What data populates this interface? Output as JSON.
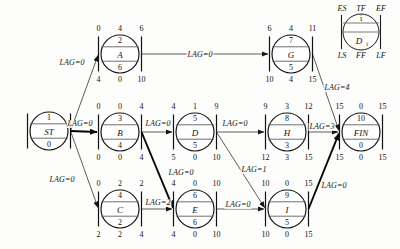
{
  "diagram": {
    "legend": {
      "top": [
        "ES",
        "TF",
        "EF"
      ],
      "bottom": [
        "LS",
        "FF",
        "LF"
      ],
      "id": "i",
      "name": "D",
      "name_sub": "i"
    },
    "nodes": [
      {
        "key": "ST",
        "id": "1",
        "name": "ST",
        "dur": "0",
        "es": "",
        "tf": "",
        "ef": "",
        "ls": "",
        "ff": "",
        "lf": "",
        "cx": 49,
        "cy": 131,
        "r": 19
      },
      {
        "key": "A",
        "id": "2",
        "name": "A",
        "dur": "6",
        "es": "0",
        "tf": "4",
        "ef": "6",
        "ls": "4",
        "ff": "0",
        "lf": "10",
        "cx": 120,
        "cy": 54,
        "r": 19
      },
      {
        "key": "B",
        "id": "3",
        "name": "B",
        "dur": "4",
        "es": "0",
        "tf": "0",
        "ef": "4",
        "ls": "0",
        "ff": "0",
        "lf": "4",
        "cx": 120,
        "cy": 132,
        "r": 19
      },
      {
        "key": "C",
        "id": "4",
        "name": "C",
        "dur": "2",
        "es": "0",
        "tf": "2",
        "ef": "2",
        "ls": "2",
        "ff": "2",
        "lf": "4",
        "cx": 120,
        "cy": 209,
        "r": 19
      },
      {
        "key": "D",
        "id": "5",
        "name": "D",
        "dur": "5",
        "es": "4",
        "tf": "1",
        "ef": "9",
        "ls": "5",
        "ff": "0",
        "lf": "10",
        "cx": 195,
        "cy": 132,
        "r": 19
      },
      {
        "key": "E",
        "id": "6",
        "name": "E",
        "dur": "6",
        "es": "4",
        "tf": "0",
        "ef": "10",
        "ls": "4",
        "ff": "0",
        "lf": "10",
        "cx": 195,
        "cy": 209,
        "r": 19
      },
      {
        "key": "G",
        "id": "7",
        "name": "G",
        "dur": "5",
        "es": "6",
        "tf": "4",
        "ef": "11",
        "ls": "10",
        "ff": "4",
        "lf": "15",
        "cx": 291,
        "cy": 54,
        "r": 19
      },
      {
        "key": "H",
        "id": "8",
        "name": "H",
        "dur": "3",
        "es": "9",
        "tf": "3",
        "ef": "12",
        "ls": "12",
        "ff": "3",
        "lf": "15",
        "cx": 287,
        "cy": 132,
        "r": 19
      },
      {
        "key": "I",
        "id": "9",
        "name": "I",
        "dur": "5",
        "es": "10",
        "tf": "0",
        "ef": "15",
        "ls": "10",
        "ff": "0",
        "lf": "15",
        "cx": 287,
        "cy": 209,
        "r": 19
      },
      {
        "key": "FIN",
        "id": "10",
        "name": "FIN",
        "dur": "0",
        "es": "15",
        "tf": "0",
        "ef": "15",
        "ls": "15",
        "ff": "0",
        "lf": "15",
        "cx": 361,
        "cy": 132,
        "r": 19
      }
    ],
    "edges": [
      {
        "from": "ST",
        "to": "A",
        "lag_label": "LAG=0",
        "lx": 72,
        "ly": 63,
        "heavy": false
      },
      {
        "from": "ST",
        "to": "B",
        "lag_label": "LAG=0",
        "lx": 80,
        "ly": 124,
        "heavy": true
      },
      {
        "from": "ST",
        "to": "C",
        "lag_label": "LAG=0",
        "lx": 62,
        "ly": 180,
        "heavy": false
      },
      {
        "from": "A",
        "to": "G",
        "lag_label": "LAG=0",
        "lx": 200,
        "ly": 55,
        "heavy": false
      },
      {
        "from": "B",
        "to": "D",
        "lag_label": "LAG=0",
        "lx": 158,
        "ly": 124,
        "heavy": false
      },
      {
        "from": "B",
        "to": "E",
        "lag_label": "LAG=0",
        "lx": 181,
        "ly": 173,
        "heavy": true
      },
      {
        "from": "C",
        "to": "E",
        "lag_label": "LAG=2",
        "lx": 158,
        "ly": 203,
        "heavy": false
      },
      {
        "from": "D",
        "to": "H",
        "lag_label": "LAG=0",
        "lx": 235,
        "ly": 124,
        "heavy": false
      },
      {
        "from": "D",
        "to": "I",
        "lag_label": "LAG=1",
        "lx": 254,
        "ly": 170,
        "heavy": false
      },
      {
        "from": "E",
        "to": "I",
        "lag_label": "LAG=0",
        "lx": 238,
        "ly": 205,
        "heavy": false
      },
      {
        "from": "G",
        "to": "FIN",
        "lag_label": "LAG=4",
        "lx": 337,
        "ly": 88,
        "heavy": false
      },
      {
        "from": "H",
        "to": "FIN",
        "lag_label": "LAG=3",
        "lx": 322,
        "ly": 127,
        "heavy": false
      },
      {
        "from": "I",
        "to": "FIN",
        "lag_label": "LAG=0",
        "lx": 334,
        "ly": 186,
        "heavy": true
      }
    ]
  }
}
